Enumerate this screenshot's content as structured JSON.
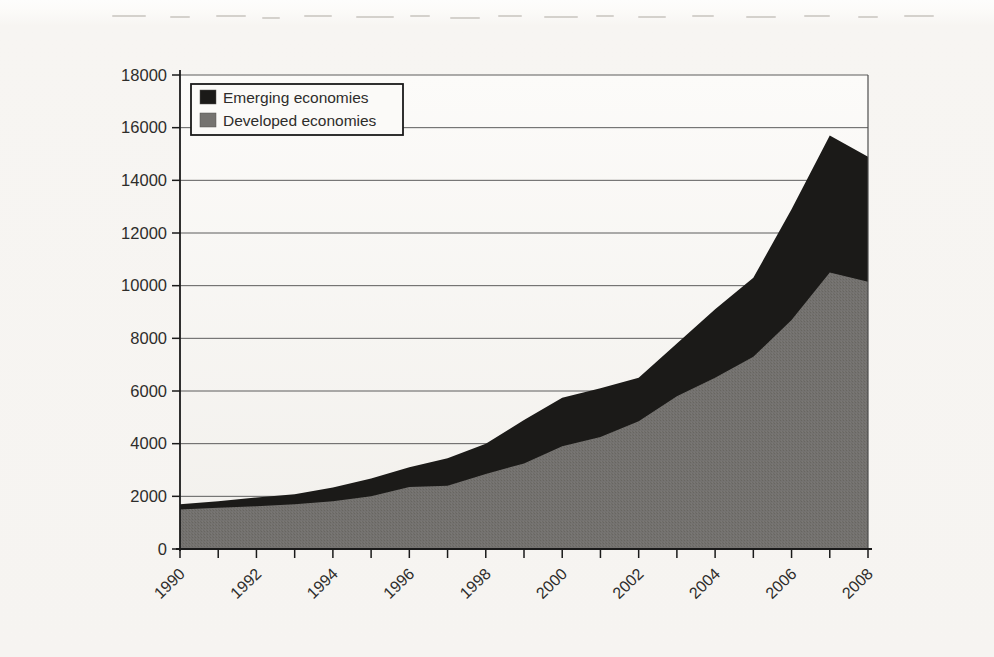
{
  "figure_kind": "scanned stacked area chart",
  "chart_data": {
    "type": "area",
    "stacked": true,
    "title": "",
    "xlabel": "",
    "ylabel": "",
    "x": [
      1990,
      1991,
      1992,
      1993,
      1994,
      1995,
      1996,
      1997,
      1998,
      1999,
      2000,
      2001,
      2002,
      2003,
      2004,
      2005,
      2006,
      2007,
      2008
    ],
    "series": [
      {
        "name": "Emerging economies",
        "color": "#1b1a18",
        "values": [
          200,
          240,
          340,
          380,
          530,
          680,
          750,
          1050,
          1150,
          1650,
          1840,
          1850,
          1650,
          2000,
          2600,
          3000,
          4200,
          5200,
          4750
        ]
      },
      {
        "name": "Developed economies",
        "color": "#757370",
        "values": [
          1500,
          1570,
          1620,
          1700,
          1810,
          2000,
          2350,
          2400,
          2850,
          3250,
          3900,
          4250,
          4850,
          5800,
          6500,
          7300,
          8700,
          10500,
          10150
        ]
      }
    ],
    "stack_bottom_series": "Developed economies",
    "ylim": [
      0,
      18000
    ],
    "yticks": [
      0,
      2000,
      4000,
      6000,
      8000,
      10000,
      12000,
      14000,
      16000,
      18000
    ],
    "ytick_labels": [
      "0",
      "2000",
      "4000",
      "6000",
      "8000",
      "10000",
      "12000",
      "14000",
      "16000",
      "18000"
    ],
    "xticks_years": [
      1990,
      1991,
      1992,
      1993,
      1994,
      1995,
      1996,
      1997,
      1998,
      1999,
      2000,
      2001,
      2002,
      2003,
      2004,
      2005,
      2006,
      2007,
      2008
    ],
    "xtick_labels": [
      "1990",
      "1992",
      "1994",
      "1996",
      "1998",
      "2000",
      "2002",
      "2004",
      "2006",
      "2008"
    ],
    "xtick_label_rotation_deg": -44,
    "grid": "horizontal",
    "legend_position": "top-left",
    "plot_border": true,
    "colors": {
      "plot_bg_top": "#fcfbf9",
      "plot_bg_bottom": "#f2f0ec",
      "gridline": "#4d4d4d",
      "axis": "#1a1a1a",
      "legend_bg": "#fbfaf8",
      "legend_border": "#1a1a1a",
      "tick_text": "#2e2d2b"
    }
  }
}
